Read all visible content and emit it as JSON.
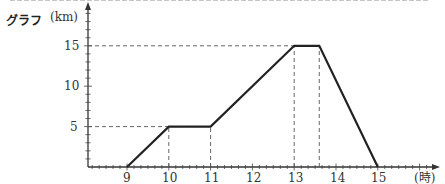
{
  "header": {
    "graph_title": "グラフ"
  },
  "chart_data": {
    "type": "line",
    "title": "グラフ",
    "xlabel": "(時)",
    "ylabel": "(km)",
    "x_ticks": [
      9,
      10,
      11,
      12,
      13,
      14,
      15
    ],
    "y_ticks": [
      5,
      10,
      15
    ],
    "xlim": [
      8,
      16
    ],
    "ylim": [
      0,
      17
    ],
    "grid": false,
    "series": [
      {
        "name": "distance",
        "x": [
          9,
          10,
          11,
          13,
          13.6,
          15
        ],
        "y": [
          0,
          5,
          5,
          15,
          15,
          0
        ]
      }
    ],
    "guide_lines": {
      "horizontal": [
        5,
        15
      ],
      "vertical": [
        10,
        11,
        13,
        13.6
      ]
    }
  },
  "labels": {
    "y_unit": "(km)",
    "x_unit": "(時)",
    "y5": "5",
    "y10": "10",
    "y15": "15",
    "x9": "9",
    "x10": "10",
    "x11": "11",
    "x12": "12",
    "x13": "13",
    "x14": "14",
    "x15": "15"
  }
}
